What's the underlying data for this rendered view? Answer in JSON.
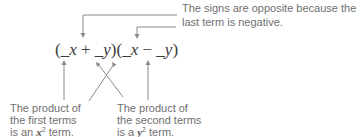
{
  "annotation_top": {
    "line1": "The signs are opposite because the",
    "line2": "last term is negative."
  },
  "equation": {
    "open1": "(",
    "blank1": "_",
    "x1": "x",
    "plus": " + ",
    "blank2": "_",
    "y1": "y",
    "close1": ")",
    "open2": "(",
    "blank3": "_",
    "x2": "x",
    "minus": " − ",
    "blank4": "_",
    "y2": "y",
    "close2": ")"
  },
  "annotation_left": {
    "line1": "The product of",
    "line2": "the first terms",
    "line3_prefix": "is an ",
    "line3_var": "x",
    "line3_exp": "2",
    "line3_suffix": " term."
  },
  "annotation_right": {
    "line1": "The product of",
    "line2": "the second terms",
    "line3_prefix": "is a ",
    "line3_var": "y",
    "line3_exp": "2",
    "line3_suffix": " term."
  },
  "colors": {
    "line": "#8a8a8a",
    "text": "#6f6f6f",
    "equation": "#3a3a3a"
  }
}
